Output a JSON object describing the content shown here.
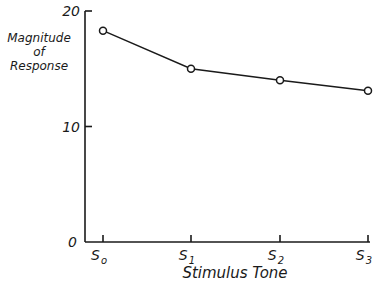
{
  "chart_data": {
    "type": "line",
    "title": "",
    "xlabel": "Stimulus Tone",
    "ylabel": "Magnitude of Response",
    "ylabel_lines": [
      "Magnitude",
      "of",
      "Response"
    ],
    "categories": [
      "S0",
      "S1",
      "S2",
      "S3"
    ],
    "category_labels": [
      {
        "base": "S",
        "sub": "o"
      },
      {
        "base": "S",
        "sub": "1"
      },
      {
        "base": "S",
        "sub": "2"
      },
      {
        "base": "S",
        "sub": "3"
      }
    ],
    "series": [
      {
        "name": "Magnitude of Response",
        "values": [
          18.3,
          15.0,
          14.0,
          13.1
        ],
        "marker": "open-circle"
      }
    ],
    "yticks": [
      0,
      10,
      20
    ],
    "ytick_labels": [
      "0",
      "10",
      "20"
    ],
    "ylim": [
      0,
      20
    ],
    "grid": false,
    "legend": null,
    "colors": {
      "line": "#1a1a1a",
      "background": "#ffffff"
    }
  }
}
